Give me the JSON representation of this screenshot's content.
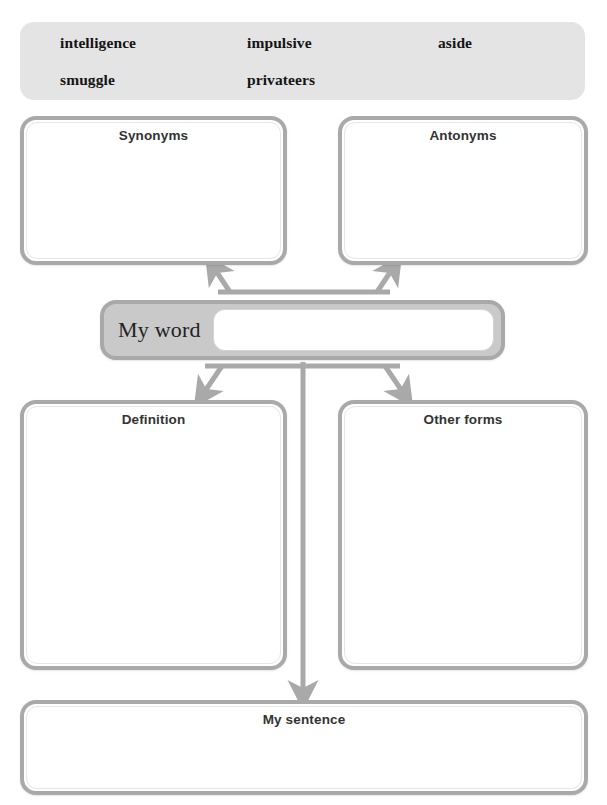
{
  "worksheet": {
    "type": "vocabulary-word-map",
    "accent_gray": "#a9a9a9",
    "bank_background": "#e4e4e4",
    "myword_background": "#c9c9c9"
  },
  "word_bank": {
    "name": "word-bank",
    "words": [
      "intelligence",
      "impulsive",
      "aside",
      "smuggle",
      "privateers",
      ""
    ]
  },
  "boxes": {
    "synonyms": {
      "title": "Synonyms",
      "value": ""
    },
    "antonyms": {
      "title": "Antonyms",
      "value": ""
    },
    "definition": {
      "title": "Definition",
      "value": ""
    },
    "otherforms": {
      "title": "Other forms",
      "value": ""
    },
    "mysentence": {
      "title": "My sentence",
      "value": ""
    }
  },
  "myword": {
    "label": "My word",
    "value": "",
    "placeholder": ""
  }
}
